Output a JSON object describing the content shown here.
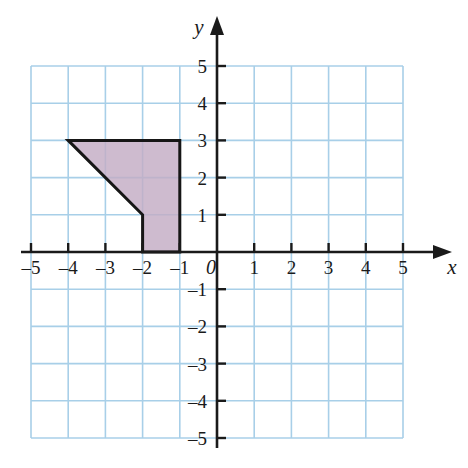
{
  "figure": {
    "background_color": "#ffffff",
    "width": 468,
    "height": 468
  },
  "chart_data": {
    "type": "scatter",
    "title": "",
    "xlabel": "x",
    "ylabel": "y",
    "origin_label": "0",
    "xlim": [
      -5,
      5
    ],
    "ylim": [
      -5,
      5
    ],
    "grid": true,
    "grid_color": "#a8cfe8",
    "axis_color": "#1a1a1a",
    "x_ticks": [
      -5,
      -4,
      -3,
      -2,
      -1,
      1,
      2,
      3,
      4,
      5
    ],
    "y_ticks": [
      -5,
      -4,
      -3,
      -2,
      -1,
      1,
      2,
      3,
      4,
      5
    ],
    "x_tick_labels": [
      "–5",
      "–4",
      "–3",
      "–2",
      "–1",
      "1",
      "2",
      "3",
      "4",
      "5"
    ],
    "y_tick_labels": [
      "–5",
      "–4",
      "–3",
      "–2",
      "–1",
      "1",
      "2",
      "3",
      "4",
      "5"
    ],
    "shapes": [
      {
        "name": "shaded-polygon",
        "type": "polygon",
        "vertices": [
          [
            -4,
            3
          ],
          [
            -1,
            3
          ],
          [
            -1,
            0
          ],
          [
            -2,
            0
          ],
          [
            -2,
            1
          ]
        ],
        "fill": "#c3acc4",
        "fill_opacity": 0.82,
        "stroke": "#161616",
        "stroke_width": 3
      }
    ]
  }
}
